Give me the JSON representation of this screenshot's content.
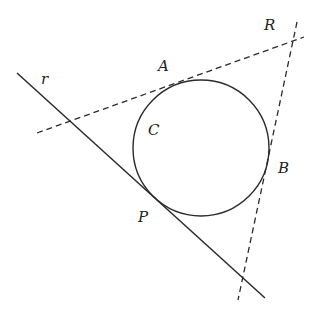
{
  "diagram": {
    "type": "geometry",
    "colors": {
      "stroke": "#2a2a2a",
      "background": "#ffffff"
    },
    "labels": {
      "r": "r",
      "A": "A",
      "R": "R",
      "C": "C",
      "B": "B",
      "P": "P"
    },
    "circle": {
      "cx": 201,
      "cy": 148,
      "r": 68
    },
    "lines": {
      "r_line": {
        "x1": 17,
        "y1": 73,
        "x2": 265,
        "y2": 298,
        "style": "solid"
      },
      "tangent_A": {
        "x1": 37,
        "y1": 133,
        "x2": 304,
        "y2": 37,
        "style": "dashed"
      },
      "tangent_B": {
        "x1": 297,
        "y1": 22,
        "x2": 238,
        "y2": 300,
        "style": "dashed"
      }
    }
  }
}
